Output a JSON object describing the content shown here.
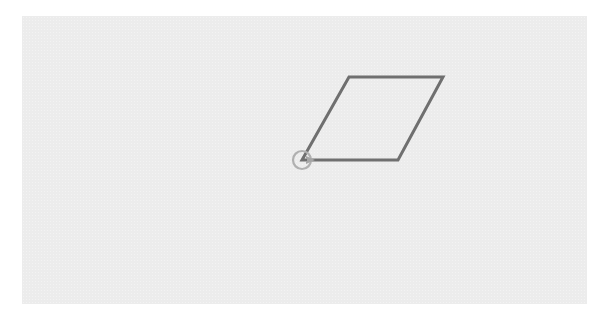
{
  "canvas": {
    "background": "#ececec",
    "x": 22,
    "y": 16,
    "width": 565,
    "height": 288
  },
  "shape": {
    "type": "parallelogram",
    "stroke": "#6f6f6f",
    "stroke_width": 3,
    "points": [
      [
        302,
        160
      ],
      [
        398,
        160
      ],
      [
        443,
        77
      ],
      [
        349,
        77
      ]
    ]
  },
  "turtle": {
    "icon": "turtle-cursor-icon",
    "x": 302,
    "y": 160,
    "heading_deg": 0,
    "circle_color": "#b0b0b0",
    "arrow_color": "#a5a5a5"
  }
}
